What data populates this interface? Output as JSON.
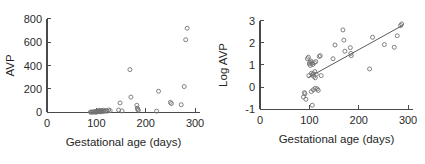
{
  "figure": {
    "background_color": "#ffffff",
    "point_color": "#737373",
    "axis_color": "#4a4a4a",
    "line_color": "#5a5a5a"
  },
  "chart_data": [
    {
      "type": "scatter",
      "panel": "left",
      "title": "",
      "xlabel": "Gestational age (days)",
      "ylabel": "AVP",
      "xlim": [
        0,
        310
      ],
      "ylim": [
        -40,
        840
      ],
      "xticks": [
        0,
        100,
        200,
        300
      ],
      "xticklabels": [
        "0",
        "100",
        "200",
        "300"
      ],
      "yticks": [
        0,
        200,
        400,
        600,
        800
      ],
      "yticklabels": [
        "0",
        "200",
        "400",
        "600",
        "800"
      ],
      "grid": false,
      "legend": false,
      "marker": "open-circle",
      "points": [
        [
          88,
          2
        ],
        [
          90,
          1
        ],
        [
          92,
          3
        ],
        [
          94,
          2
        ],
        [
          96,
          5
        ],
        [
          98,
          4
        ],
        [
          99,
          1
        ],
        [
          100,
          8
        ],
        [
          101,
          3
        ],
        [
          102,
          12
        ],
        [
          103,
          6
        ],
        [
          104,
          10
        ],
        [
          105,
          14
        ],
        [
          106,
          9
        ],
        [
          107,
          4
        ],
        [
          108,
          16
        ],
        [
          109,
          11
        ],
        [
          110,
          7
        ],
        [
          111,
          13
        ],
        [
          112,
          5
        ],
        [
          114,
          18
        ],
        [
          116,
          9
        ],
        [
          118,
          12
        ],
        [
          120,
          15
        ],
        [
          122,
          10
        ],
        [
          125,
          20
        ],
        [
          128,
          14
        ],
        [
          145,
          20
        ],
        [
          148,
          80
        ],
        [
          152,
          12
        ],
        [
          168,
          365
        ],
        [
          170,
          130
        ],
        [
          182,
          60
        ],
        [
          183,
          35
        ],
        [
          184,
          25
        ],
        [
          185,
          18
        ],
        [
          222,
          10
        ],
        [
          226,
          180
        ],
        [
          250,
          85
        ],
        [
          252,
          75
        ],
        [
          272,
          65
        ],
        [
          278,
          220
        ],
        [
          281,
          620
        ],
        [
          284,
          718
        ]
      ]
    },
    {
      "type": "scatter",
      "panel": "right",
      "title": "",
      "xlabel": "Gestational age (days)",
      "ylabel": "Log AVP",
      "xlim": [
        0,
        310
      ],
      "ylim": [
        -1.35,
        3.3
      ],
      "xticks": [
        0,
        100,
        200,
        300
      ],
      "xticklabels": [
        "0",
        "100",
        "200",
        "300"
      ],
      "yticks": [
        -1,
        0,
        1,
        2,
        3
      ],
      "yticklabels": [
        "-1",
        "0",
        "1",
        "2",
        "3"
      ],
      "grid": false,
      "legend": false,
      "marker": "open-circle",
      "points": [
        [
          88,
          -0.45
        ],
        [
          90,
          -0.25
        ],
        [
          91,
          -0.3
        ],
        [
          93,
          -0.55
        ],
        [
          96,
          1.28
        ],
        [
          98,
          1.35
        ],
        [
          99,
          0.52
        ],
        [
          100,
          1.05
        ],
        [
          101,
          1.12
        ],
        [
          102,
          0.98
        ],
        [
          103,
          1.18
        ],
        [
          104,
          0.62
        ],
        [
          105,
          1.08
        ],
        [
          106,
          0.55
        ],
        [
          107,
          1.02
        ],
        [
          108,
          0.6
        ],
        [
          109,
          0.48
        ],
        [
          110,
          1.1
        ],
        [
          111,
          0.7
        ],
        [
          112,
          0.42
        ],
        [
          113,
          1.15
        ],
        [
          114,
          0.58
        ],
        [
          104,
          -0.2
        ],
        [
          106,
          -0.82
        ],
        [
          108,
          -0.12
        ],
        [
          112,
          -0.05
        ],
        [
          116,
          -0.08
        ],
        [
          118,
          -0.15
        ],
        [
          120,
          1.38
        ],
        [
          122,
          1.42
        ],
        [
          124,
          0.52
        ],
        [
          148,
          1.28
        ],
        [
          152,
          1.9
        ],
        [
          168,
          2.58
        ],
        [
          170,
          2.12
        ],
        [
          172,
          1.62
        ],
        [
          183,
          1.78
        ],
        [
          184,
          1.52
        ],
        [
          185,
          1.42
        ],
        [
          222,
          0.82
        ],
        [
          228,
          2.25
        ],
        [
          252,
          1.92
        ],
        [
          272,
          1.8
        ],
        [
          278,
          2.32
        ],
        [
          285,
          2.78
        ],
        [
          287,
          2.85
        ]
      ],
      "regression": {
        "visible": true,
        "x_start": 97,
        "y_start": 0.42,
        "x_end": 290,
        "y_end": 2.8
      }
    }
  ]
}
